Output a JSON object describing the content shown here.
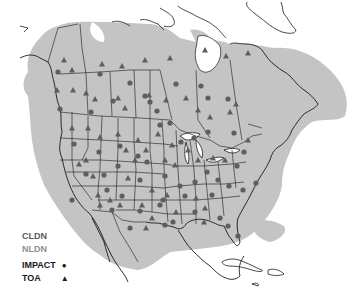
{
  "map": {
    "title": "North American lightning detection network sensor locations",
    "region": "North America",
    "colors": {
      "coverage": "#c4c4c4",
      "background": "#ffffff",
      "borders": "#1a1a1a",
      "sensor": "#5e5e5e"
    }
  },
  "legend": {
    "items": [
      {
        "label": "CLDN",
        "color": "#5a5a5a"
      },
      {
        "label": "NLDN",
        "color": "#8f8f8f"
      },
      {
        "label": "IMPACT",
        "symbol": "●"
      },
      {
        "label": "TOA",
        "symbol": "▲"
      }
    ]
  },
  "sensors": {
    "impact": [
      [
        58,
        72
      ],
      [
        100,
        74
      ],
      [
        130,
        83
      ],
      [
        145,
        96
      ],
      [
        157,
        111
      ],
      [
        176,
        84
      ],
      [
        201,
        86
      ],
      [
        208,
        98
      ],
      [
        228,
        99
      ],
      [
        60,
        109
      ],
      [
        91,
        112
      ],
      [
        113,
        101
      ],
      [
        150,
        102
      ],
      [
        74,
        144
      ],
      [
        99,
        152
      ],
      [
        120,
        146
      ],
      [
        138,
        156
      ],
      [
        147,
        162
      ],
      [
        160,
        125
      ],
      [
        170,
        123
      ],
      [
        181,
        142
      ],
      [
        194,
        138
      ],
      [
        208,
        132
      ],
      [
        234,
        133
      ],
      [
        237,
        166
      ],
      [
        243,
        190
      ],
      [
        256,
        183
      ],
      [
        104,
        175
      ],
      [
        118,
        166
      ],
      [
        140,
        180
      ],
      [
        165,
        176
      ],
      [
        180,
        186
      ],
      [
        195,
        182
      ],
      [
        207,
        172
      ],
      [
        218,
        180
      ],
      [
        107,
        190
      ],
      [
        122,
        196
      ],
      [
        163,
        200
      ],
      [
        185,
        196
      ],
      [
        212,
        195
      ],
      [
        229,
        186
      ],
      [
        140,
        211
      ],
      [
        160,
        205
      ],
      [
        173,
        222
      ],
      [
        195,
        212
      ],
      [
        220,
        218
      ],
      [
        228,
        226
      ],
      [
        238,
        236
      ],
      [
        165,
        225
      ],
      [
        130,
        228
      ],
      [
        112,
        210
      ],
      [
        86,
        174
      ],
      [
        72,
        200
      ],
      [
        244,
        152
      ]
    ],
    "toa": [
      [
        64,
        60
      ],
      [
        72,
        70
      ],
      [
        102,
        64
      ],
      [
        122,
        66
      ],
      [
        145,
        60
      ],
      [
        170,
        58
      ],
      [
        205,
        50
      ],
      [
        226,
        56
      ],
      [
        248,
        53
      ],
      [
        57,
        90
      ],
      [
        73,
        90
      ],
      [
        86,
        93
      ],
      [
        95,
        99
      ],
      [
        118,
        98
      ],
      [
        125,
        108
      ],
      [
        149,
        95
      ],
      [
        166,
        100
      ],
      [
        186,
        98
      ],
      [
        198,
        110
      ],
      [
        210,
        117
      ],
      [
        230,
        112
      ],
      [
        236,
        104
      ],
      [
        248,
        140
      ],
      [
        72,
        128
      ],
      [
        88,
        128
      ],
      [
        100,
        137
      ],
      [
        118,
        134
      ],
      [
        138,
        140
      ],
      [
        158,
        134
      ],
      [
        172,
        145
      ],
      [
        188,
        150
      ],
      [
        86,
        160
      ],
      [
        126,
        150
      ],
      [
        135,
        160
      ],
      [
        146,
        150
      ],
      [
        165,
        160
      ],
      [
        175,
        165
      ],
      [
        198,
        160
      ],
      [
        213,
        158
      ],
      [
        225,
        160
      ],
      [
        93,
        176
      ],
      [
        128,
        178
      ],
      [
        152,
        190
      ],
      [
        167,
        195
      ],
      [
        196,
        198
      ],
      [
        205,
        208
      ],
      [
        120,
        205
      ],
      [
        110,
        200
      ],
      [
        100,
        205
      ],
      [
        79,
        164
      ],
      [
        98,
        195
      ],
      [
        142,
        205
      ],
      [
        152,
        218
      ],
      [
        176,
        212
      ],
      [
        204,
        222
      ],
      [
        146,
        228
      ]
    ]
  }
}
